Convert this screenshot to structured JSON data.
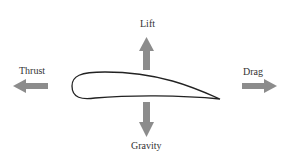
{
  "diagram": {
    "labels": {
      "lift": "Lift",
      "thrust": "Thrust",
      "drag": "Drag",
      "gravity": "Gravity"
    },
    "colors": {
      "arrow": "#8c8c8c",
      "outline": "#222222",
      "text": "#333333"
    }
  }
}
